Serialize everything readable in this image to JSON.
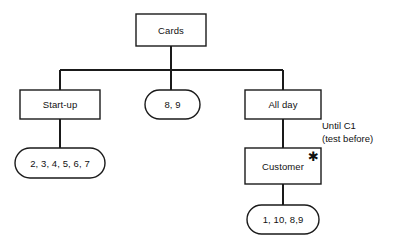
{
  "diagram": {
    "type": "hierarchy-tree",
    "background_color": "#ffffff",
    "stroke_color": "#1a1a1a",
    "text_color": "#111111",
    "nodes": [
      {
        "id": "cards",
        "label": "Cards",
        "shape": "rectangle",
        "x": 136,
        "y": 14,
        "w": 70,
        "h": 32
      },
      {
        "id": "startup",
        "label": "Start-up",
        "shape": "rectangle",
        "x": 20,
        "y": 90,
        "w": 80,
        "h": 29
      },
      {
        "id": "eightnine",
        "label": "8, 9",
        "shape": "stadium",
        "x": 145,
        "y": 90,
        "w": 55,
        "h": 29
      },
      {
        "id": "allday",
        "label": "All day",
        "shape": "rectangle",
        "x": 245,
        "y": 90,
        "w": 76,
        "h": 29
      },
      {
        "id": "startlist",
        "label": "2, 3, 4, 5, 6, 7",
        "shape": "stadium",
        "x": 15,
        "y": 148,
        "w": 90,
        "h": 30
      },
      {
        "id": "customer",
        "label": "Customer",
        "shape": "rectangle",
        "x": 245,
        "y": 148,
        "w": 76,
        "h": 36
      },
      {
        "id": "custlist",
        "label": "1, 10, 8,9",
        "shape": "stadium",
        "x": 247,
        "y": 205,
        "w": 72,
        "h": 29
      }
    ],
    "marks": [
      {
        "id": "customer-star",
        "glyph": "✱",
        "x": 308,
        "y": 150,
        "attached_to": "customer"
      }
    ],
    "annotation": {
      "line1": "Until C1",
      "line2": "(test before)",
      "x": 322,
      "y": 120
    },
    "edges": [
      {
        "from": "cards",
        "to": "bus",
        "kind": "vertical"
      },
      {
        "from": "bus",
        "to": "startup",
        "kind": "elbow"
      },
      {
        "from": "bus",
        "to": "eightnine",
        "kind": "vertical"
      },
      {
        "from": "bus",
        "to": "allday",
        "kind": "elbow"
      },
      {
        "from": "startup",
        "to": "startlist",
        "kind": "vertical"
      },
      {
        "from": "allday",
        "to": "customer",
        "kind": "vertical"
      },
      {
        "from": "customer",
        "to": "custlist",
        "kind": "vertical"
      }
    ]
  }
}
